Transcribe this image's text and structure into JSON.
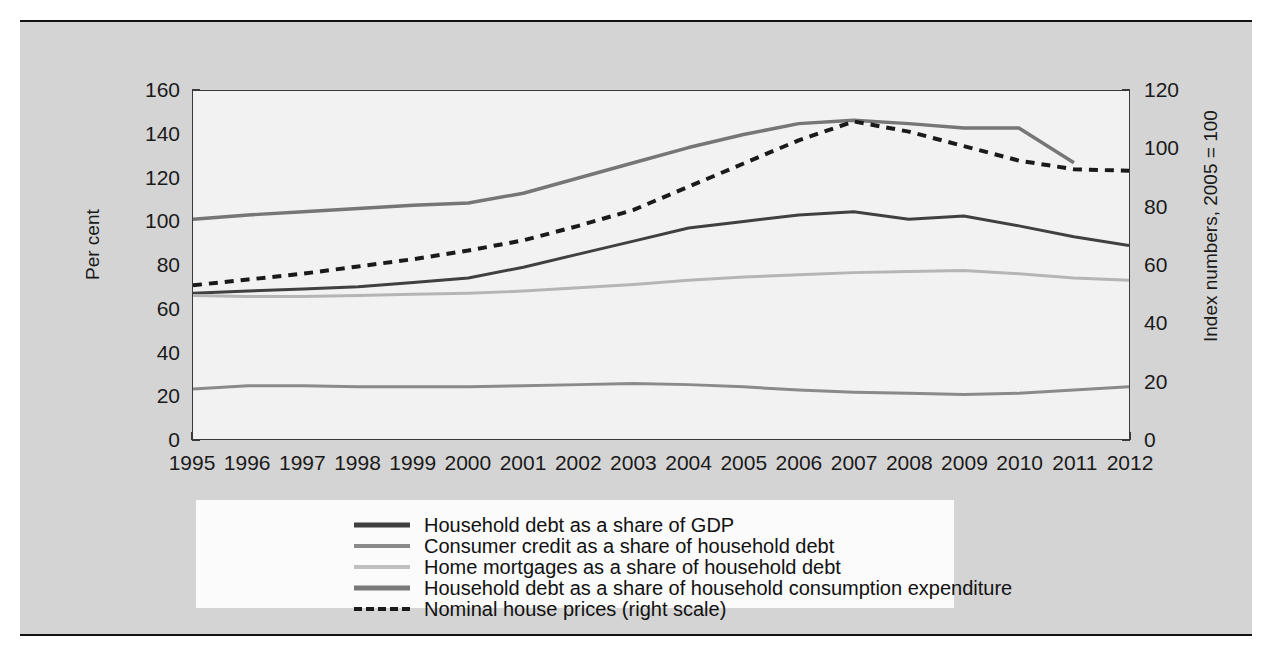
{
  "chart_data": {
    "type": "line",
    "title": "",
    "xlabel": "",
    "ylabel": "Per cent",
    "y2label": "Index numbers, 2005 = 100",
    "grid": false,
    "legend_position": "bottom",
    "xlim": [
      1995,
      2012
    ],
    "ylim": [
      0,
      160
    ],
    "y2lim": [
      0,
      120
    ],
    "x": [
      1995,
      1996,
      1997,
      1998,
      1999,
      2000,
      2001,
      2002,
      2003,
      2004,
      2005,
      2006,
      2007,
      2008,
      2009,
      2010,
      2011,
      2012
    ],
    "xticks": [
      "1995",
      "1996",
      "1997",
      "1998",
      "1999",
      "2000",
      "2001",
      "2002",
      "2003",
      "2004",
      "2005",
      "2006",
      "2007",
      "2008",
      "2009",
      "2010",
      "2011",
      "2012"
    ],
    "yticks_left": [
      "0",
      "20",
      "40",
      "60",
      "80",
      "100",
      "120",
      "140",
      "160"
    ],
    "yticks_right": [
      "0",
      "20",
      "40",
      "60",
      "80",
      "100",
      "120"
    ],
    "series": [
      {
        "name": "Household debt as a share of GDP",
        "axis": "left",
        "style": "solid",
        "color": "#404040",
        "width": 3.0,
        "values": [
          67,
          68,
          69,
          70,
          72,
          74,
          79,
          85,
          91,
          97,
          100,
          103,
          104.5,
          101,
          102.5,
          98,
          93,
          89
        ]
      },
      {
        "name": "Consumer credit as a share of household debt",
        "axis": "left",
        "style": "solid",
        "color": "#8a8a8a",
        "width": 3.0,
        "values": [
          23,
          24.5,
          24.5,
          24,
          24,
          24,
          24.5,
          25,
          25.5,
          25,
          24,
          22.5,
          21.5,
          21,
          20.5,
          21,
          22.5,
          24
        ]
      },
      {
        "name": "Home mortgages as a share of household debt",
        "axis": "left",
        "style": "solid",
        "color": "#b5b5b5",
        "width": 3.0,
        "values": [
          66,
          65.5,
          65.5,
          66,
          66.5,
          67,
          68,
          69.5,
          71,
          73,
          74.5,
          75.5,
          76.5,
          77,
          77.5,
          76,
          74,
          73
        ]
      },
      {
        "name": "Household debt as a share of household consumption expenditure",
        "axis": "left",
        "style": "solid",
        "color": "#767676",
        "width": 3.5,
        "values": [
          101,
          103,
          104.5,
          106,
          107.5,
          108.5,
          113,
          120,
          127,
          134,
          140,
          145,
          146.5,
          145,
          143,
          143,
          127,
          null
        ]
      },
      {
        "name": "Nominal house prices (right scale)",
        "axis": "right",
        "style": "dashed",
        "color": "#1a1a1a",
        "width": 4.0,
        "values": [
          53,
          55,
          57,
          59.5,
          62,
          65,
          68.5,
          73.5,
          79,
          87,
          95,
          103,
          109.5,
          106,
          101,
          96,
          93,
          92.5
        ]
      }
    ]
  },
  "legend": {
    "items": [
      {
        "label": "Household debt as a share of GDP",
        "color": "#404040",
        "style": "solid",
        "thickness": "5px"
      },
      {
        "label": "Consumer credit as a share of household debt",
        "color": "#8a8a8a",
        "style": "solid",
        "thickness": "4px"
      },
      {
        "label": "Home mortgages as a share of household debt",
        "color": "#c0c0c0",
        "style": "solid",
        "thickness": "4px"
      },
      {
        "label": "Household debt as a share of household consumption expenditure",
        "color": "#7a7a7a",
        "style": "solid",
        "thickness": "5px"
      },
      {
        "label": "Nominal house prices (right scale)",
        "color": "#1a1a1a",
        "style": "dashed",
        "thickness": "4px"
      }
    ]
  },
  "axes": {
    "left_title": "Per cent",
    "right_title": "Index numbers, 2005 = 100"
  }
}
